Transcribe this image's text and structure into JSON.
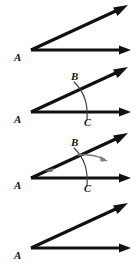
{
  "figure": {
    "panel_count": 4,
    "background_color": "#ffffff",
    "line_color": "#111111",
    "arc_color": "#3a3a3a",
    "sweep_color": "#7d7d7d"
  },
  "panels": [
    {
      "id": "panel-1",
      "step": "1",
      "description": "Given angle with vertex A and two rays",
      "vertex_label": "A",
      "labels": [
        "A"
      ],
      "has_arc": false,
      "has_sweep_arrow": false,
      "rays": [
        {
          "name": "upper-ray",
          "from": [
            31,
            50
          ],
          "to": [
            127,
            6
          ]
        },
        {
          "name": "horizontal-ray",
          "from": [
            31,
            50
          ],
          "to": [
            129,
            50
          ]
        }
      ]
    },
    {
      "id": "panel-2",
      "step": "2",
      "description": "Arc drawn from vertex A crossing both rays at B and C",
      "vertex_label": "A",
      "labels": [
        "A",
        "B",
        "C"
      ],
      "has_arc": true,
      "has_sweep_arrow": false,
      "arc_point_upper": "B",
      "arc_point_lower": "C",
      "rays": [
        {
          "name": "upper-ray",
          "from": [
            31,
            50
          ],
          "to": [
            127,
            6
          ]
        },
        {
          "name": "horizontal-ray",
          "from": [
            31,
            50
          ],
          "to": [
            129,
            50
          ]
        }
      ]
    },
    {
      "id": "panel-3",
      "step": "3",
      "description": "Compass sweep from point B outward along the arc",
      "vertex_label": "A",
      "labels": [
        "A",
        "B",
        "C"
      ],
      "has_arc": true,
      "has_sweep_arrow": true,
      "arc_point_upper": "B",
      "arc_point_lower": "C",
      "rays": [
        {
          "name": "upper-ray",
          "from": [
            31,
            50
          ],
          "to": [
            127,
            6
          ]
        },
        {
          "name": "horizontal-ray",
          "from": [
            31,
            50
          ],
          "to": [
            129,
            50
          ]
        }
      ]
    },
    {
      "id": "panel-4",
      "step": "4",
      "description": "Resulting copied angle with vertex A",
      "vertex_label": "A",
      "labels": [
        "A"
      ],
      "has_arc": false,
      "has_sweep_arrow": false,
      "rays": [
        {
          "name": "upper-ray",
          "from": [
            31,
            52
          ],
          "to": [
            127,
            8
          ]
        },
        {
          "name": "horizontal-ray",
          "from": [
            31,
            52
          ],
          "to": [
            129,
            52
          ]
        }
      ]
    }
  ],
  "labels": {
    "a": "A",
    "b": "B",
    "c": "C"
  }
}
